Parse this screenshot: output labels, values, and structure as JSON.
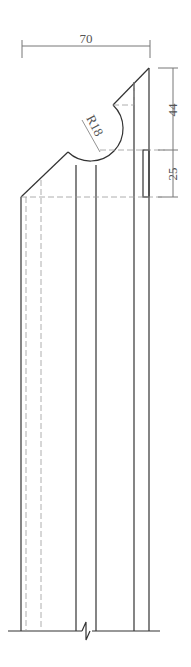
{
  "drawing": {
    "type": "technical-section-drawing",
    "dimensions": {
      "width_top": "70",
      "height_upper": "44",
      "height_lower": "25",
      "radius": "R18"
    },
    "colors": {
      "line": "#333333",
      "dim_line": "#777777",
      "hidden_line": "#999999",
      "background": "#ffffff"
    }
  }
}
